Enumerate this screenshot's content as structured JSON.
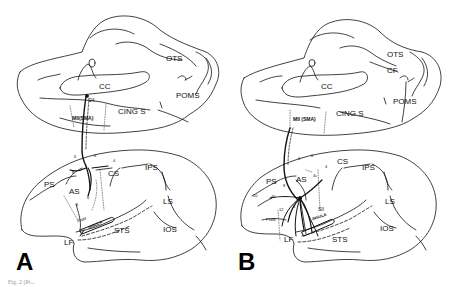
{
  "figure": {
    "caption": "Fig. 2 (Pr...",
    "panels": [
      {
        "id": "A",
        "letter": "A",
        "medial_view": {
          "labels": {
            "otS": "OTS",
            "cc": "CC",
            "poms": "POMS",
            "cing_s": "CING S",
            "area24": "24",
            "mii_sma": "MII(SMA)"
          }
        },
        "lateral_view": {
          "labels": {
            "ps": "PS",
            "as": "AS",
            "cs": "CS",
            "ips": "IPS",
            "ls": "LS",
            "ios": "IOS",
            "sts": "STS",
            "lf": "LF",
            "insula": "INSULA",
            "area6a": "6",
            "area6b": "6",
            "area8": "8",
            "area4": "4",
            "area6c": "6",
            "area6d": "6",
            "pro_m": "ProM"
          }
        }
      },
      {
        "id": "B",
        "letter": "B",
        "medial_view": {
          "labels": {
            "ots": "OTS",
            "cf": "CF",
            "cc": "CC",
            "poms": "POMS",
            "cing_s": "CING S",
            "mii_sma": "MII (SMA)"
          }
        },
        "lateral_view": {
          "labels": {
            "ps": "PS",
            "as": "AS",
            "cs": "CS",
            "ips": "IPS",
            "ls": "LS",
            "ios": "IOS",
            "sts": "STS",
            "lf": "LF",
            "insula": "INSULA",
            "sii": "SII",
            "area10": "10",
            "area46": "46",
            "area8": "8",
            "area12": "12",
            "area6a": "6",
            "area6b": "6",
            "area6c": "6",
            "area4": "4",
            "area4c": "4c",
            "pro_m": "ProM"
          }
        }
      }
    ]
  }
}
